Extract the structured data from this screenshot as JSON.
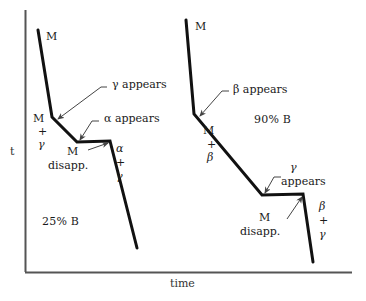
{
  "figure": {
    "title": "",
    "axes": {
      "y_label": "t",
      "x_label": "time"
    },
    "curves": [
      {
        "name": "curve-25-percent-B",
        "composition_label": "25% B",
        "segments": [
          {
            "from": [
              38,
              30
            ],
            "to": [
              52,
              117
            ]
          },
          {
            "from": [
              52,
              117
            ],
            "to": [
              77,
              142
            ]
          },
          {
            "from": [
              77,
              142
            ],
            "to": [
              110,
              141
            ]
          },
          {
            "from": [
              110,
              141
            ],
            "to": [
              137,
              248
            ]
          }
        ],
        "region_labels": [
          {
            "text": "M",
            "x": 46,
            "y": 36
          },
          {
            "text": "M",
            "x": 36,
            "y": 119
          },
          {
            "text": "+",
            "x": 40,
            "y": 131
          },
          {
            "text": "γ",
            "x": 41,
            "y": 145
          },
          {
            "text": "M",
            "x": 70,
            "y": 152
          },
          {
            "text": "disapp.",
            "x": 51,
            "y": 166
          },
          {
            "text": "α",
            "x": 117,
            "y": 148
          },
          {
            "text": "+",
            "x": 117,
            "y": 162
          },
          {
            "text": "γ",
            "x": 117,
            "y": 177
          }
        ],
        "annotations": [
          {
            "text": "γ appears",
            "x": 113,
            "y": 84,
            "tip": [
              57,
              119
            ],
            "elbow": [
              104,
              88
            ],
            "tail": [
              97,
              88
            ]
          },
          {
            "text": "α appears",
            "x": 104,
            "y": 118,
            "tip": [
              79,
              141
            ],
            "elbow": [
              96,
              122
            ],
            "tail": [
              89,
              122
            ]
          }
        ]
      },
      {
        "name": "curve-90-percent-B",
        "composition_label": "90% B",
        "segments": [
          {
            "from": [
              186,
              20
            ],
            "to": [
              194,
              114
            ]
          },
          {
            "from": [
              194,
              114
            ],
            "to": [
              262,
              195
            ]
          },
          {
            "from": [
              262,
              195
            ],
            "to": [
              303,
              194
            ]
          },
          {
            "from": [
              303,
              194
            ],
            "to": [
              313,
              262
            ]
          }
        ],
        "region_labels": [
          {
            "text": "M",
            "x": 196,
            "y": 26
          },
          {
            "text": "M",
            "x": 206,
            "y": 131
          },
          {
            "text": "+",
            "x": 210,
            "y": 144
          },
          {
            "text": "β",
            "x": 210,
            "y": 158
          },
          {
            "text": "M",
            "x": 262,
            "y": 218
          },
          {
            "text": "disapp.",
            "x": 243,
            "y": 232
          },
          {
            "text": "β",
            "x": 320,
            "y": 207
          },
          {
            "text": "+",
            "x": 320,
            "y": 220
          },
          {
            "text": "γ",
            "x": 320,
            "y": 235
          }
        ],
        "annotations": [
          {
            "text": "β appears",
            "x": 234,
            "y": 89,
            "tip": [
              199,
              116
            ],
            "elbow": [
              226,
              92
            ],
            "tail": [
              219,
              92
            ]
          },
          {
            "text": "γ",
            "x": 291,
            "y": 167,
            "tip": null,
            "elbow": null,
            "tail": null
          },
          {
            "text": "appears",
            "x": 283,
            "y": 181,
            "tip": [
              264,
              193
            ],
            "elbow": [
              278,
              176
            ],
            "tail": [
              271,
              176
            ]
          }
        ]
      }
    ],
    "composition_annotations": [
      {
        "text": "25% B",
        "x": 45,
        "y": 222
      },
      {
        "text": "90% B",
        "x": 257,
        "y": 120
      }
    ],
    "colors": {
      "line": "#111111",
      "axis": "#555555",
      "text": "#1a1a1a"
    }
  }
}
